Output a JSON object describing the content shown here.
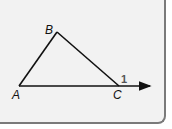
{
  "diagram": {
    "type": "triangle-exterior-angle",
    "vertices": {
      "A": {
        "label": "A",
        "x": 19,
        "y": 86
      },
      "B": {
        "label": "B",
        "x": 57,
        "y": 32
      },
      "C": {
        "label": "C",
        "x": 119,
        "y": 86
      }
    },
    "ray_end": {
      "x": 151,
      "y": 86
    },
    "angle_label": "1",
    "colors": {
      "line": "#111111",
      "background": "#f2f2f2",
      "border": "#7a7a7a",
      "angle_label": "#555555"
    }
  }
}
